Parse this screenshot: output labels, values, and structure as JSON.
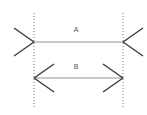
{
  "figure": {
    "type": "muller-lyer-illusion-diagram",
    "background_color": "#ffffff",
    "canvas": {
      "width": 147,
      "height": 115
    },
    "reference_lines": {
      "name": "vertical-dotted-reference-lines",
      "color": "#777777",
      "dash": "1,2",
      "stroke_width": 1,
      "left_x": 34,
      "right_x": 123,
      "y_top": 13,
      "y_bottom": 107
    },
    "shaft_color": "#c9c9c9",
    "shaft_stroke_width": 2,
    "fin_color": "#3a3a3a",
    "fin_stroke_width": 1.4,
    "label_color": "#555555",
    "segments": [
      {
        "id": "A",
        "label": "A",
        "label_x": 76,
        "label_y": 30,
        "shaft_y": 42,
        "x_start": 34,
        "x_end": 123,
        "fin_direction": "outward",
        "fin_length_x": 20,
        "fin_length_y": 14,
        "description": "horizontal line A with outward pointing fins"
      },
      {
        "id": "B",
        "label": "B",
        "label_x": 76,
        "label_y": 67,
        "shaft_y": 78,
        "x_start": 34,
        "x_end": 123,
        "fin_direction": "inward",
        "fin_length_x": 20,
        "fin_length_y": 14,
        "description": "horizontal line B with inward pointing arrowheads"
      }
    ]
  }
}
